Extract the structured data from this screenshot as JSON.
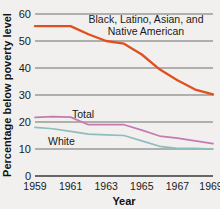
{
  "chart_data": {
    "type": "line",
    "title": "",
    "xlabel": "Year",
    "ylabel": "Percentage below poverty level",
    "xlim": [
      1959,
      1969
    ],
    "ylim": [
      0,
      60
    ],
    "grid": true,
    "legend_position": "inline-annotations",
    "xticks": [
      "1959",
      "1961",
      "1963",
      "1965",
      "1967",
      "1969"
    ],
    "xtick_values": [
      1959,
      1961,
      1963,
      1965,
      1967,
      1969
    ],
    "yticks": [
      "0",
      "10",
      "20",
      "30",
      "40",
      "50",
      "60"
    ],
    "ytick_values": [
      0,
      10,
      20,
      30,
      40,
      50,
      60
    ],
    "x": [
      1959,
      1960,
      1961,
      1962,
      1963,
      1964,
      1965,
      1966,
      1967,
      1968,
      1969
    ],
    "series": [
      {
        "name": "Black, Latino, Asian, and Native American",
        "label_line1": "Black, Latino, Asian, and",
        "label_line2": "Native American",
        "color": "#e0501e",
        "values": [
          55.5,
          55.5,
          55.5,
          52.5,
          50.0,
          49.0,
          45.0,
          39.5,
          35.5,
          32.0,
          30.2
        ]
      },
      {
        "name": "Total",
        "label_line1": "Total",
        "label_line2": "",
        "color": "#c57bb0",
        "values": [
          21.7,
          22.0,
          21.8,
          19.0,
          19.0,
          19.0,
          17.0,
          14.8,
          14.0,
          13.0,
          12.0
        ]
      },
      {
        "name": "White",
        "label_line1": "White",
        "label_line2": "",
        "color": "#8fbcbd",
        "values": [
          18.0,
          17.5,
          16.5,
          15.5,
          15.2,
          15.0,
          13.0,
          11.0,
          10.2,
          10.2,
          10.0
        ]
      }
    ],
    "annotations": [
      {
        "text": "Black, Latino, Asian, and",
        "series": "Black, Latino, Asian, and Native American"
      },
      {
        "text": "Native American",
        "series": "Black, Latino, Asian, and Native American"
      },
      {
        "text": "Total",
        "series": "Total"
      },
      {
        "text": "White",
        "series": "White"
      }
    ]
  }
}
